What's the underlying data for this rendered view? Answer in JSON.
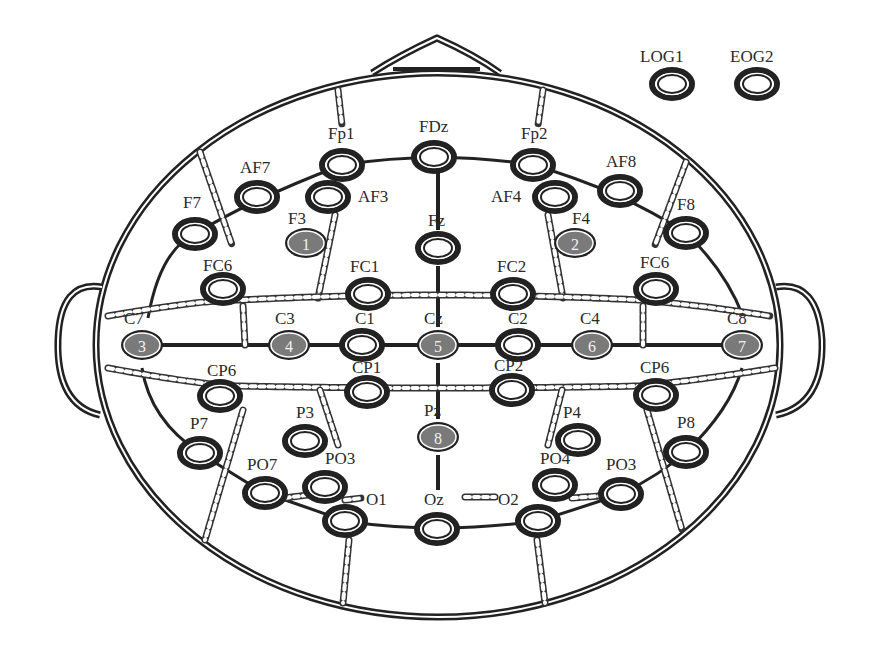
{
  "diagram": {
    "extra_channels": [
      {
        "label": "LOG1",
        "x": 672,
        "y": 84,
        "lx": 640,
        "ly": 62
      },
      {
        "label": "EOG2",
        "x": 757,
        "y": 84,
        "lx": 730,
        "ly": 62
      }
    ],
    "reference_electrodes": [
      {
        "number": "1",
        "site": "F3",
        "x": 306,
        "y": 243,
        "lx": 288,
        "ly": 224
      },
      {
        "number": "2",
        "site": "F4",
        "x": 575,
        "y": 243,
        "lx": 572,
        "ly": 224
      },
      {
        "number": "3",
        "site": "C7",
        "x": 142,
        "y": 345,
        "lx": 124,
        "ly": 324
      },
      {
        "number": "4",
        "site": "C3",
        "x": 289,
        "y": 345,
        "lx": 275,
        "ly": 324
      },
      {
        "number": "5",
        "site": "Cz",
        "x": 438,
        "y": 345,
        "lx": 424,
        "ly": 324
      },
      {
        "number": "6",
        "site": "C4",
        "x": 592,
        "y": 345,
        "lx": 580,
        "ly": 324
      },
      {
        "number": "7",
        "site": "C8",
        "x": 742,
        "y": 345,
        "lx": 727,
        "ly": 324
      },
      {
        "number": "8",
        "site": "Pz",
        "x": 438,
        "y": 437,
        "lx": 424,
        "ly": 416
      }
    ],
    "electrodes": [
      {
        "label": "Fp1",
        "x": 342,
        "y": 165,
        "lx": 328,
        "ly": 139
      },
      {
        "label": "FDz",
        "x": 434,
        "y": 157,
        "lx": 419,
        "ly": 132
      },
      {
        "label": "Fp2",
        "x": 533,
        "y": 165,
        "lx": 521,
        "ly": 139
      },
      {
        "label": "AF7",
        "x": 257,
        "y": 197,
        "lx": 240,
        "ly": 173
      },
      {
        "label": "AF3",
        "x": 328,
        "y": 197,
        "lx": 358,
        "ly": 202
      },
      {
        "label": "AF4",
        "x": 555,
        "y": 197,
        "lx": 491,
        "ly": 202
      },
      {
        "label": "AF8",
        "x": 620,
        "y": 191,
        "lx": 606,
        "ly": 167
      },
      {
        "label": "F7",
        "x": 195,
        "y": 234,
        "lx": 183,
        "ly": 208
      },
      {
        "label": "Fz",
        "x": 438,
        "y": 248,
        "lx": 428,
        "ly": 226
      },
      {
        "label": "F8",
        "x": 686,
        "y": 233,
        "lx": 677,
        "ly": 210
      },
      {
        "label": "FC6",
        "x": 223,
        "y": 289,
        "lx": 203,
        "ly": 271
      },
      {
        "label": "FC1",
        "x": 368,
        "y": 294,
        "lx": 350,
        "ly": 272
      },
      {
        "label": "FC2",
        "x": 513,
        "y": 294,
        "lx": 497,
        "ly": 272
      },
      {
        "label": "FC6",
        "x": 656,
        "y": 289,
        "lx": 640,
        "ly": 268
      },
      {
        "label": "C1",
        "x": 362,
        "y": 345,
        "lx": 355,
        "ly": 324
      },
      {
        "label": "C2",
        "x": 518,
        "y": 345,
        "lx": 508,
        "ly": 324
      },
      {
        "label": "CP6",
        "x": 220,
        "y": 396,
        "lx": 207,
        "ly": 376
      },
      {
        "label": "CP1",
        "x": 367,
        "y": 392,
        "lx": 352,
        "ly": 373
      },
      {
        "label": "CP2",
        "x": 512,
        "y": 390,
        "lx": 494,
        "ly": 371
      },
      {
        "label": "CP6",
        "x": 656,
        "y": 395,
        "lx": 640,
        "ly": 373
      },
      {
        "label": "P7",
        "x": 200,
        "y": 453,
        "lx": 190,
        "ly": 429
      },
      {
        "label": "P3",
        "x": 305,
        "y": 441,
        "lx": 296,
        "ly": 418
      },
      {
        "label": "P4",
        "x": 578,
        "y": 440,
        "lx": 563,
        "ly": 418
      },
      {
        "label": "P8",
        "x": 686,
        "y": 452,
        "lx": 677,
        "ly": 428
      },
      {
        "label": "PO7",
        "x": 265,
        "y": 493,
        "lx": 247,
        "ly": 470
      },
      {
        "label": "PO3",
        "x": 325,
        "y": 487,
        "lx": 325,
        "ly": 464
      },
      {
        "label": "PO4",
        "x": 555,
        "y": 485,
        "lx": 540,
        "ly": 464
      },
      {
        "label": "PO3",
        "x": 621,
        "y": 494,
        "lx": 606,
        "ly": 470
      },
      {
        "label": "O1",
        "x": 345,
        "y": 521,
        "lx": 366,
        "ly": 505
      },
      {
        "label": "Oz",
        "x": 437,
        "y": 529,
        "lx": 424,
        "ly": 505
      },
      {
        "label": "O2",
        "x": 538,
        "y": 521,
        "lx": 498,
        "ly": 505
      }
    ]
  },
  "colors": {
    "outline": "#222222",
    "reference_fill": "#7a7a7a",
    "reference_text": "#f2f2f2",
    "background": "#ffffff"
  }
}
